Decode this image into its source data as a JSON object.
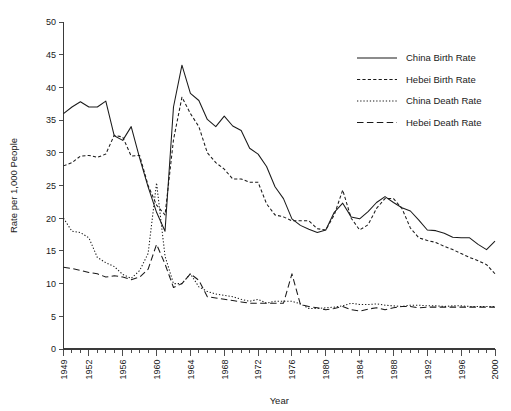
{
  "chart_data": {
    "type": "line",
    "title": "",
    "xlabel": "Year",
    "ylabel": "Rate per 1,000 People",
    "xlim": [
      1949,
      2000
    ],
    "ylim": [
      0,
      50
    ],
    "grid": false,
    "legend_position": "top-right",
    "y_ticks": [
      0,
      5,
      10,
      15,
      20,
      25,
      30,
      35,
      40,
      45,
      50
    ],
    "x_tick_labels": [
      "1949",
      "1952",
      "1956",
      "1960",
      "1964",
      "1968",
      "1972",
      "1976",
      "1980",
      "1984",
      "1988",
      "1992",
      "1996",
      "2000"
    ],
    "x_tick_values": [
      1949,
      1952,
      1956,
      1960,
      1964,
      1968,
      1972,
      1976,
      1980,
      1984,
      1988,
      1992,
      1996,
      2000
    ],
    "x_minor_step": 1,
    "x": [
      1949,
      1950,
      1951,
      1952,
      1953,
      1954,
      1955,
      1956,
      1957,
      1958,
      1959,
      1960,
      1961,
      1962,
      1963,
      1964,
      1965,
      1966,
      1967,
      1968,
      1969,
      1970,
      1971,
      1972,
      1973,
      1974,
      1975,
      1976,
      1977,
      1978,
      1979,
      1980,
      1981,
      1982,
      1983,
      1984,
      1985,
      1986,
      1987,
      1988,
      1989,
      1990,
      1991,
      1992,
      1993,
      1994,
      1995,
      1996,
      1997,
      1998,
      1999,
      2000
    ],
    "series": [
      {
        "name": "China Birth Rate",
        "style": "solid",
        "values": [
          36.0,
          37.0,
          37.8,
          37.0,
          37.0,
          37.9,
          32.6,
          31.9,
          34.0,
          29.2,
          24.8,
          20.9,
          18.0,
          37.0,
          43.4,
          39.1,
          38.0,
          35.1,
          34.0,
          35.6,
          34.1,
          33.4,
          30.7,
          29.8,
          27.9,
          24.8,
          23.0,
          19.9,
          18.9,
          18.3,
          17.8,
          18.2,
          20.9,
          22.3,
          20.2,
          19.9,
          21.0,
          22.4,
          23.3,
          22.4,
          21.6,
          21.1,
          19.7,
          18.2,
          18.1,
          17.7,
          17.1,
          17.0,
          17.0,
          16.0,
          15.2,
          16.5
        ]
      },
      {
        "name": "Hebei Birth Rate",
        "style": "dashed",
        "values": [
          28.0,
          28.5,
          29.5,
          29.6,
          29.3,
          29.8,
          32.7,
          32.4,
          29.5,
          29.6,
          25.0,
          22.0,
          20.5,
          32.0,
          38.5,
          36.0,
          34.0,
          30.0,
          28.5,
          27.5,
          26.0,
          26.0,
          25.5,
          25.5,
          22.2,
          20.5,
          20.2,
          19.6,
          19.6,
          19.6,
          18.4,
          18.2,
          20.5,
          24.3,
          20.0,
          18.2,
          19.0,
          21.5,
          23.0,
          23.0,
          21.5,
          18.5,
          17.0,
          16.6,
          16.3,
          15.7,
          15.2,
          14.6,
          14.0,
          13.5,
          12.9,
          11.5
        ]
      },
      {
        "name": "China Death Rate",
        "style": "dotted",
        "values": [
          20.0,
          18.0,
          17.8,
          17.0,
          14.0,
          13.2,
          12.6,
          11.4,
          10.8,
          12.0,
          14.6,
          25.4,
          14.2,
          10.0,
          10.0,
          11.5,
          9.5,
          8.8,
          8.4,
          8.2,
          8.0,
          7.6,
          7.3,
          7.6,
          7.0,
          7.3,
          7.3,
          7.3,
          6.9,
          6.2,
          6.2,
          6.3,
          6.4,
          6.6,
          7.0,
          6.8,
          6.8,
          6.9,
          6.7,
          6.6,
          6.5,
          6.7,
          6.7,
          6.6,
          6.6,
          6.5,
          6.6,
          6.6,
          6.5,
          6.5,
          6.5,
          6.5
        ]
      },
      {
        "name": "Hebei Death Rate",
        "style": "long-dashed",
        "values": [
          12.5,
          12.3,
          12.0,
          11.7,
          11.5,
          11.0,
          11.2,
          11.0,
          10.6,
          11.0,
          12.2,
          16.0,
          13.0,
          9.4,
          10.0,
          11.5,
          10.5,
          8.0,
          7.8,
          7.6,
          7.4,
          7.2,
          7.0,
          7.0,
          7.0,
          7.0,
          7.0,
          11.5,
          6.8,
          6.5,
          6.3,
          6.0,
          6.2,
          6.5,
          6.0,
          5.8,
          6.1,
          6.3,
          6.0,
          6.3,
          6.5,
          6.5,
          6.3,
          6.4,
          6.4,
          6.4,
          6.4,
          6.4,
          6.4,
          6.4,
          6.4,
          6.4
        ]
      }
    ]
  },
  "legend": {
    "entries": [
      {
        "label": "China Birth Rate",
        "style": "solid"
      },
      {
        "label": "Hebei Birth Rate",
        "style": "dashed"
      },
      {
        "label": "China Death Rate",
        "style": "dotted"
      },
      {
        "label": "Hebei Death Rate",
        "style": "long-dashed"
      }
    ]
  },
  "axes": {
    "x_title": "Year",
    "y_title": "Rate per 1,000 People"
  },
  "colors": {
    "ink": "#1a1a1a",
    "axis": "#3a3a3a",
    "background": "#ffffff"
  }
}
